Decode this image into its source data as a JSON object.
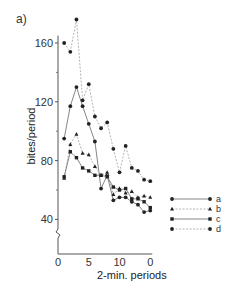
{
  "panel_label": "a)",
  "chart_data": {
    "type": "line",
    "title": "",
    "xlabel": "2-min. periods",
    "ylabel": "bites/period",
    "x_ticks": [
      "0",
      "5",
      "10",
      "0"
    ],
    "x_tick_values": [
      0,
      5,
      10,
      15
    ],
    "y_ticks": [
      "40",
      "80",
      "120",
      "160"
    ],
    "y_tick_values": [
      40,
      80,
      120,
      160
    ],
    "ylim": [
      20,
      180
    ],
    "xlim": [
      0,
      15
    ],
    "grid": false,
    "axis_break": true,
    "legend_position": "right",
    "x": [
      1,
      2,
      3,
      4,
      5,
      6,
      7,
      8,
      9,
      10,
      11,
      12,
      13,
      14,
      15
    ],
    "series": [
      {
        "name": "a",
        "line": "solid",
        "marker": "circle",
        "values": [
          95,
          117,
          130,
          117,
          105,
          93,
          61,
          70,
          53,
          55,
          55,
          52,
          50,
          45,
          46
        ]
      },
      {
        "name": "b",
        "line": "dashed",
        "marker": "triangle",
        "values": [
          68,
          91,
          98,
          85,
          84,
          76,
          70,
          72,
          57,
          61,
          58,
          59,
          55,
          56,
          55
        ]
      },
      {
        "name": "c",
        "line": "solid",
        "marker": "square",
        "values": [
          69,
          86,
          82,
          75,
          73,
          70,
          70,
          69,
          62,
          60,
          61,
          54,
          54,
          52,
          48
        ]
      },
      {
        "name": "d",
        "line": "dashed",
        "marker": "circle",
        "values": [
          160,
          154,
          176,
          121,
          132,
          110,
          102,
          106,
          88,
          72,
          90,
          75,
          73,
          67,
          66
        ]
      }
    ]
  }
}
